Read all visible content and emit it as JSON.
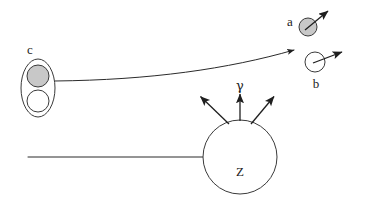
{
  "figure": {
    "background_color": "#ffffff",
    "line_color": "#2b2b2b",
    "fill_gray": "#c8c8c8",
    "fill_white": "#ffffff",
    "width": 368,
    "height": 201,
    "labels": {
      "a": "a",
      "b": "b",
      "c": "c",
      "z": "Z",
      "gamma": "γ"
    },
    "elements": [
      {
        "name": "composite-particle-c",
        "label": "c",
        "label_position": {
          "x": 30,
          "y": 50
        },
        "outer_ellipse": {
          "cx": 38,
          "cy": 88,
          "rx": 17,
          "ry": 29,
          "fill": "#ffffff"
        },
        "inner_circles": [
          {
            "name": "nucleon-filled",
            "cx": 38,
            "cy": 76,
            "r": 11,
            "fill": "#c8c8c8"
          },
          {
            "name": "nucleon-empty",
            "cx": 38,
            "cy": 101,
            "r": 11,
            "fill": "#ffffff"
          }
        ]
      },
      {
        "name": "particle-a",
        "label": "a",
        "label_position": {
          "x": 290,
          "y": 22
        },
        "circle": {
          "cx": 308,
          "cy": 27,
          "r": 9,
          "fill": "#c8c8c8"
        },
        "momentum_arrow": {
          "x1": 305,
          "y1": 30,
          "x2": 330,
          "y2": 9
        }
      },
      {
        "name": "particle-b",
        "label": "b",
        "label_position": {
          "x": 316,
          "y": 84
        },
        "circle": {
          "cx": 315,
          "cy": 62,
          "r": 10,
          "fill": "#ffffff"
        },
        "momentum_arrow": {
          "x1": 313,
          "y1": 63,
          "x2": 344,
          "y2": 51
        }
      },
      {
        "name": "nucleus-z",
        "label": "Z",
        "label_position": {
          "x": 240,
          "y": 172
        },
        "circle": {
          "cx": 240,
          "cy": 157,
          "r": 37,
          "fill": "#ffffff"
        },
        "incoming_axis": {
          "x1": 28,
          "y1": 157,
          "x2": 240,
          "y2": 157
        }
      },
      {
        "name": "gamma-emission",
        "label": "γ",
        "label_position": {
          "x": 240,
          "y": 90
        },
        "arrows": [
          {
            "name": "gamma-arrow-left",
            "x1": 229,
            "y1": 123,
            "x2": 199,
            "y2": 95
          },
          {
            "name": "gamma-arrow-center",
            "x1": 240,
            "y1": 121,
            "x2": 240,
            "y2": 93
          },
          {
            "name": "gamma-arrow-right",
            "x1": 251,
            "y1": 123,
            "x2": 275,
            "y2": 95
          }
        ]
      },
      {
        "name": "trajectory-curve",
        "description": "curved path from composite particle c deflecting upward toward particle b",
        "start": {
          "x": 55,
          "y": 81
        },
        "control1": {
          "x": 150,
          "y": 80
        },
        "control2": {
          "x": 230,
          "y": 68
        },
        "end": {
          "x": 299,
          "y": 48
        }
      }
    ]
  }
}
